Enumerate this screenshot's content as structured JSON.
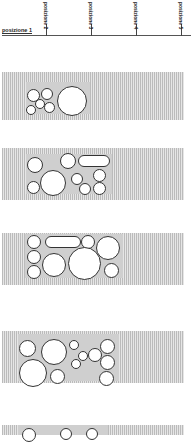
{
  "axis": {
    "labels": [
      "posizione 1",
      "posizione 2",
      "posizione 3",
      "posizione 4",
      "posizione 5"
    ]
  },
  "panels": [
    {
      "name": "position-1-panel"
    },
    {
      "name": "position-2-panel"
    },
    {
      "name": "position-3-panel"
    },
    {
      "name": "position-4-panel"
    },
    {
      "name": "position-5-panel"
    }
  ]
}
